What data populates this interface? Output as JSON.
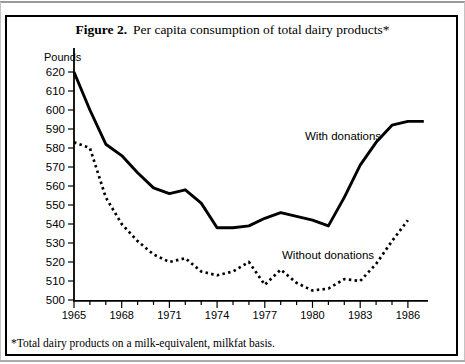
{
  "figure": {
    "title_prefix": "Figure 2.",
    "title_text": "Per capita consumption of total dairy products*",
    "footnote": "*Total dairy products on a milk-equivalent, milkfat basis."
  },
  "chart_data": {
    "type": "line",
    "xlabel": "",
    "ylabel": "Pounds",
    "ylim": [
      500,
      620
    ],
    "y_tick_step": 10,
    "grid": false,
    "legend_position": "inline-annotations",
    "x_ticks": [
      1965,
      1966,
      1967,
      1968,
      1969,
      1970,
      1971,
      1972,
      1973,
      1974,
      1975,
      1976,
      1977,
      1978,
      1979,
      1980,
      1981,
      1982,
      1983,
      1984,
      1985,
      1986
    ],
    "x_labeled_ticks": [
      1965,
      1968,
      1971,
      1974,
      1977,
      1980,
      1983,
      1986
    ],
    "line_color": "#000000",
    "background_color": "#ffffff",
    "series": [
      {
        "name": "With donations",
        "line_style": "solid",
        "x": [
          1965,
          1966,
          1967,
          1968,
          1969,
          1970,
          1971,
          1972,
          1973,
          1974,
          1975,
          1976,
          1977,
          1978,
          1979,
          1980,
          1981,
          1982,
          1983,
          1984,
          1985,
          1986,
          1987
        ],
        "values": [
          620,
          600,
          582,
          576,
          567,
          559,
          556,
          558,
          551,
          538,
          538,
          539,
          543,
          546,
          544,
          542,
          539,
          554,
          571,
          583,
          592,
          594,
          594
        ]
      },
      {
        "name": "Without donations",
        "line_style": "dotted",
        "x": [
          1965,
          1966,
          1967,
          1968,
          1969,
          1970,
          1971,
          1972,
          1973,
          1974,
          1975,
          1976,
          1977,
          1978,
          1979,
          1980,
          1981,
          1982,
          1983,
          1984,
          1985,
          1986
        ],
        "values": [
          583,
          580,
          554,
          540,
          531,
          524,
          520,
          522,
          515,
          513,
          515,
          520,
          508,
          516,
          509,
          505,
          506,
          511,
          510,
          519,
          531,
          542
        ]
      }
    ]
  }
}
